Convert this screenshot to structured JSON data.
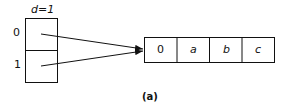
{
  "directory": {
    "depth_label": "d=1",
    "rows": [
      {
        "index": "0"
      },
      {
        "index": "1"
      }
    ]
  },
  "bucket": {
    "cells": [
      "0",
      "a",
      "b",
      "c"
    ]
  },
  "caption": "(a)",
  "colors": {
    "stroke": "#111111",
    "background": "#ffffff"
  }
}
